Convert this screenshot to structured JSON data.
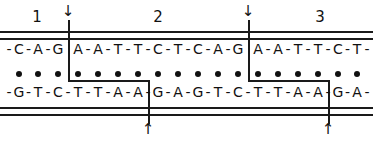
{
  "figure": {
    "segments": [
      {
        "label": "1",
        "x": 37
      },
      {
        "label": "2",
        "x": 158
      },
      {
        "label": "3",
        "x": 320
      }
    ],
    "top_arrows": [
      {
        "glyph": "↓",
        "x": 68
      },
      {
        "glyph": "↓",
        "x": 248
      }
    ],
    "bottom_arrows": [
      {
        "glyph": "↑",
        "x": 148
      },
      {
        "glyph": "↑",
        "x": 328
      }
    ],
    "top_strand": [
      "C",
      "A",
      "G",
      "A",
      "A",
      "T",
      "T",
      "C",
      "T",
      "C",
      "A",
      "G",
      "A",
      "A",
      "T",
      "T",
      "C",
      "T"
    ],
    "bottom_strand": [
      "G",
      "T",
      "C",
      "T",
      "T",
      "A",
      "A",
      "G",
      "A",
      "G",
      "T",
      "C",
      "T",
      "T",
      "A",
      "A",
      "G",
      "A"
    ],
    "base_positions": [
      19,
      38,
      58,
      78,
      98,
      118,
      138,
      158,
      178,
      198,
      218,
      238,
      258,
      278,
      298,
      318,
      338,
      357
    ],
    "pair_symbol": "•",
    "top_cut_after_index": [
      2,
      11
    ],
    "bottom_cut_after_index": [
      6,
      15
    ]
  }
}
